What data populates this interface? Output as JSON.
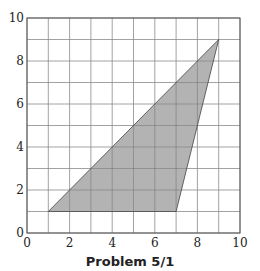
{
  "figure": {
    "caption": "Problem 5/1",
    "fill_color": "#b3b3b3",
    "grid_color": "#8a8a8a",
    "axis_color": "#555555"
  },
  "chart_data": {
    "type": "area",
    "title": "",
    "caption": "Problem 5/1",
    "xlabel": "",
    "ylabel": "",
    "xlim": [
      0,
      10
    ],
    "ylim": [
      0,
      10
    ],
    "grid": true,
    "x_ticks": [
      0,
      2,
      4,
      6,
      8,
      10
    ],
    "y_ticks": [
      0,
      2,
      4,
      6,
      8,
      10
    ],
    "x_tick_labels": [
      "0",
      "2",
      "4",
      "6",
      "8",
      "10"
    ],
    "y_tick_labels": [
      "0",
      "2",
      "4",
      "6",
      "8",
      "10"
    ],
    "series": [
      {
        "name": "shaded triangle",
        "shape": "polygon",
        "vertices": [
          [
            1,
            1
          ],
          [
            7,
            1
          ],
          [
            9,
            9
          ]
        ]
      }
    ]
  }
}
